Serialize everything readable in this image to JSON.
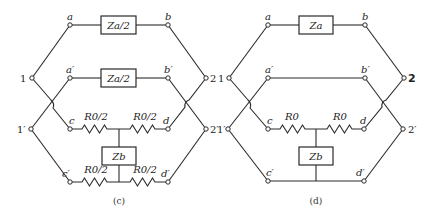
{
  "diagram": {
    "panels": [
      {
        "caption": "(c)",
        "terminals": {
          "t1": "1",
          "t1p": "1′",
          "t2": "2",
          "t2p": "2′"
        },
        "nodes": {
          "a": "a",
          "ap": "a′",
          "b": "b",
          "bp": "b′",
          "c": "c",
          "cp": "c′",
          "d": "d",
          "dp": "d′"
        },
        "series_upper": "Za/2",
        "series_lower": "Za/2",
        "shunt": "Zb",
        "resistors": {
          "top_left": "R0/2",
          "top_right": "R0/2",
          "bottom_left": "R0/2",
          "bottom_right": "R0/2"
        }
      },
      {
        "caption": "(d)",
        "terminals": {
          "t1": "1",
          "t1p": "1′",
          "t2": "2",
          "t2p": "2′"
        },
        "nodes": {
          "a": "a",
          "ap": "a′",
          "b": "b",
          "bp": "b′",
          "c": "c",
          "cp": "c′",
          "d": "d",
          "dp": "d′"
        },
        "series_upper": "Za",
        "shunt": "Zb",
        "resistors": {
          "top_left": "R0",
          "top_right": "R0"
        }
      }
    ]
  }
}
